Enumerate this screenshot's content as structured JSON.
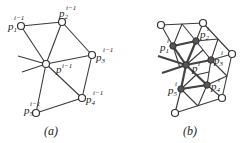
{
  "panel_a": {
    "caption": "(a)",
    "center": {
      "label": "p",
      "sup": "i−1"
    },
    "nodes": [
      {
        "label": "p",
        "sub": "1",
        "sup": "i−1"
      },
      {
        "label": "p",
        "sub": "2",
        "sup": "i−1"
      },
      {
        "label": "p",
        "sub": "3",
        "sup": "i−1"
      },
      {
        "label": "p",
        "sub": "4",
        "sup": "i−1"
      },
      {
        "label": "p",
        "sub": "5",
        "sup": "i−1"
      }
    ]
  },
  "panel_b": {
    "caption": "(b)",
    "center": {
      "label": "p",
      "sup": "i"
    },
    "nodes": [
      {
        "label": "p",
        "sub": "1",
        "sup": "i"
      },
      {
        "label": "p",
        "sub": "2",
        "sup": "i"
      },
      {
        "label": "p",
        "sub": "3",
        "sup": "i"
      },
      {
        "label": "p",
        "sub": "4",
        "sup": "i"
      },
      {
        "label": "p",
        "sub": "5",
        "sup": "i"
      }
    ]
  }
}
